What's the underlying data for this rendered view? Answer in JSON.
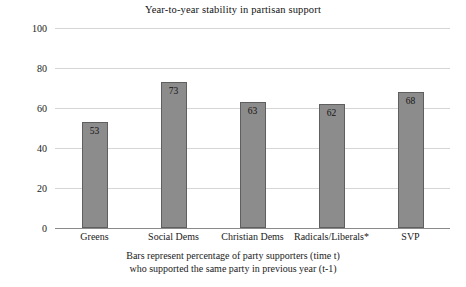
{
  "chart_data": {
    "type": "bar",
    "title": "Year-to-year stability in partisan support",
    "categories": [
      "Greens",
      "Social Dems",
      "Christian Dems",
      "Radicals/Liberals*",
      "SVP"
    ],
    "values": [
      53,
      73,
      63,
      62,
      68
    ],
    "xlabel": "",
    "ylabel": "",
    "ylim": [
      0,
      100
    ],
    "yticks": [
      0,
      20,
      40,
      60,
      80,
      100
    ],
    "ytick_labels": [
      "0",
      "20",
      "40",
      "60",
      "80",
      "100"
    ],
    "grid": true,
    "legend": false,
    "bar_color": "#8c8c8c",
    "bar_edge_color": "#5f5f5f",
    "grid_color": "#d6d6d6",
    "axis_color": "#8a8a8a",
    "data_labels": [
      "53",
      "73",
      "63",
      "62",
      "68"
    ],
    "annotations": [
      "Bars represent percentage of party supporters (time t)",
      "who supported the same party in previous year (t-1)"
    ]
  },
  "caption": {
    "line1": "Bars represent percentage of party supporters (time t)",
    "line2": "who supported the same party in previous year (t-1)"
  }
}
